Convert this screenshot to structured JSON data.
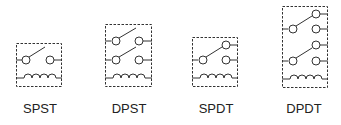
{
  "relays": [
    {
      "id": "spst",
      "label": "SPST",
      "poles": 1,
      "throws": 1
    },
    {
      "id": "dpst",
      "label": "DPST",
      "poles": 2,
      "throws": 1
    },
    {
      "id": "spdt",
      "label": "SPDT",
      "poles": 1,
      "throws": 2
    },
    {
      "id": "dpdt",
      "label": "DPDT",
      "poles": 2,
      "throws": 2
    }
  ],
  "colors": {
    "stroke": "#333333",
    "background": "#ffffff",
    "text": "#222222"
  }
}
